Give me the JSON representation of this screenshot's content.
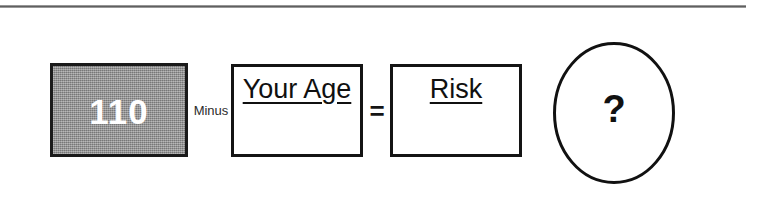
{
  "diagram": {
    "title_rule": "horizontal-rule",
    "formula": {
      "constant": {
        "value": "110",
        "fill_color": "#8f8f8f",
        "text_color": "#ffffff",
        "border_color": "#1a1a1a"
      },
      "operator_minus": "Minus",
      "operand": {
        "label": "Your Age",
        "value": ""
      },
      "operator_equals": "=",
      "result": {
        "label": "Risk",
        "value": ""
      },
      "outcome": {
        "label": "?",
        "shape": "ellipse",
        "border_color": "#111111"
      }
    }
  }
}
